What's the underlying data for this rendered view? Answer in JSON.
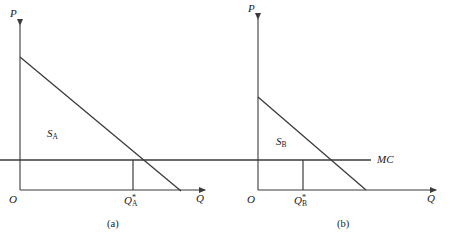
{
  "figure": {
    "type": "diagram",
    "line_color": "#3b3b3b",
    "text_color": "#1a1a1a",
    "background": "#ffffff"
  },
  "panels": [
    {
      "id": "a",
      "caption": "(a)",
      "y_axis_label": "P",
      "x_axis_label": "Q",
      "origin_label": "O",
      "curve_label_base": "S",
      "curve_label_sub": "A",
      "quantity_label_base": "Q",
      "quantity_label_sup": "*",
      "quantity_label_sub": "A",
      "geometry": {
        "origin": [
          20,
          190
        ],
        "y_axis_top": [
          20,
          20
        ],
        "x_axis_right": [
          210,
          190
        ],
        "demand_start": [
          20,
          57
        ],
        "demand_end": [
          181,
          191
        ],
        "mc_level_y": 160,
        "equilibrium_x": 133
      }
    },
    {
      "id": "b",
      "caption": "(b)",
      "y_axis_label": "P",
      "x_axis_label": "Q",
      "origin_label": "O",
      "curve_label_base": "S",
      "curve_label_sub": "B",
      "quantity_label_base": "Q",
      "quantity_label_sup": "*",
      "quantity_label_sub": "B",
      "geometry": {
        "origin": [
          258,
          190
        ],
        "y_axis_top": [
          258,
          14
        ],
        "x_axis_right": [
          440,
          190
        ],
        "demand_start": [
          258,
          97
        ],
        "demand_end": [
          366,
          190
        ],
        "mc_level_y": 160,
        "equilibrium_x": 303
      }
    }
  ],
  "shared": {
    "mc_label": "MC",
    "mc_line": {
      "y": 160,
      "x_start": 0,
      "x_end": 371
    }
  }
}
